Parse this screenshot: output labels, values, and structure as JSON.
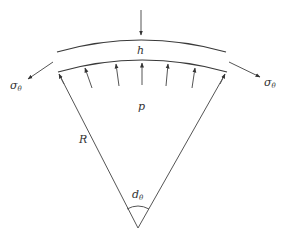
{
  "diagram": {
    "labels": {
      "thickness": "h",
      "pressure": "p",
      "radius": "R",
      "angle_main": "d",
      "angle_sub": "θ",
      "stress_left_main": "σ",
      "stress_left_sub": "θ",
      "stress_right_main": "σ",
      "stress_right_sub": "θ"
    },
    "colors": {
      "stroke": "#3a3a3a",
      "text": "#333333",
      "background": "#ffffff"
    },
    "pressure_arrow_count": 5
  }
}
